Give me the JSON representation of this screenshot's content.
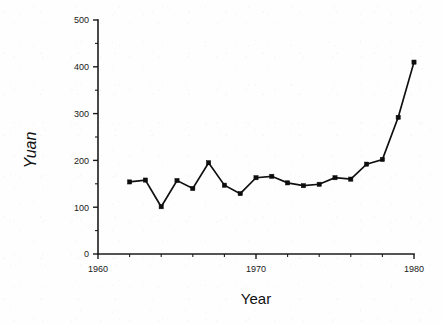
{
  "chart_data": {
    "type": "line",
    "title": "",
    "xlabel": "Year",
    "ylabel": "Yuan",
    "xlim": [
      1960,
      1980
    ],
    "ylim": [
      0,
      500
    ],
    "grid": false,
    "legend": null,
    "marker": "square",
    "x_ticks": [
      1960,
      1970,
      1980
    ],
    "x_tick_labels": [
      "1960",
      "1970",
      "1980"
    ],
    "x_minor_tick_step": 2,
    "y_ticks": [
      0,
      100,
      200,
      300,
      400,
      500
    ],
    "y_tick_labels": [
      "0",
      "100",
      "200",
      "300",
      "400",
      "500"
    ],
    "y_minor_tick_step": 50,
    "x": [
      1962,
      1963,
      1964,
      1965,
      1966,
      1967,
      1968,
      1969,
      1970,
      1971,
      1972,
      1973,
      1974,
      1975,
      1976,
      1977,
      1978,
      1979,
      1980
    ],
    "values": [
      154,
      158,
      101,
      157,
      140,
      195,
      147,
      129,
      163,
      166,
      152,
      146,
      149,
      163,
      160,
      192,
      202,
      292,
      410
    ],
    "series": [
      {
        "name": "Yuan",
        "x": [
          1962,
          1963,
          1964,
          1965,
          1966,
          1967,
          1968,
          1969,
          1970,
          1971,
          1972,
          1973,
          1974,
          1975,
          1976,
          1977,
          1978,
          1979,
          1980
        ],
        "values": [
          154,
          158,
          101,
          157,
          140,
          195,
          147,
          129,
          163,
          166,
          152,
          146,
          149,
          163,
          160,
          192,
          202,
          292,
          410
        ]
      }
    ]
  },
  "axes": {
    "y_axis_label": "Yuan",
    "x_axis_label": "Year",
    "y_ticks": [
      {
        "label": "500",
        "value": 500
      },
      {
        "label": "400",
        "value": 400
      },
      {
        "label": "300",
        "value": 300
      },
      {
        "label": "200",
        "value": 200
      },
      {
        "label": "100",
        "value": 100
      },
      {
        "label": "0",
        "value": 0
      }
    ],
    "x_ticks": [
      {
        "label": "1960",
        "value": 1960
      },
      {
        "label": "1970",
        "value": 1970
      },
      {
        "label": "1980",
        "value": 1980
      }
    ]
  },
  "colors": {
    "ink": "#101010",
    "paper": "#fefefe",
    "marker": "#0d0d0d"
  }
}
